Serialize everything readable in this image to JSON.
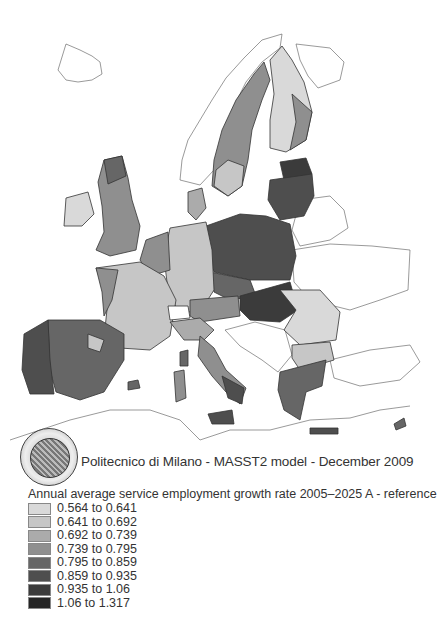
{
  "map": {
    "title": "Annual average service employment growth rate 2005–2025 A - reference",
    "caption": "Politecnico di Milano - MASST2 model - December 2009",
    "seal_text": "POLITECNICO DI MILANO",
    "classes": [
      {
        "label": "0.564 to 0.641",
        "color": "#d9d9d9"
      },
      {
        "label": "0.641 to 0.692",
        "color": "#c6c6c6"
      },
      {
        "label": "0.692 to 0.739",
        "color": "#ababab"
      },
      {
        "label": "0.739 to 0.795",
        "color": "#8f8f8f"
      },
      {
        "label": "0.795 to 0.859",
        "color": "#666666"
      },
      {
        "label": "0.859 to 0.935",
        "color": "#4e4e4e"
      },
      {
        "label": "0.935 to 1.06",
        "color": "#3b3b3b"
      },
      {
        "label": "1.06 to 1.317",
        "color": "#242424"
      }
    ],
    "regions": [
      {
        "name": "Norway",
        "class": null
      },
      {
        "name": "Sweden",
        "class": 3
      },
      {
        "name": "Finland",
        "class": 1
      },
      {
        "name": "Estonia/Latvia/Lithuania",
        "class": 6
      },
      {
        "name": "Poland",
        "class": 6
      },
      {
        "name": "Czech Republic",
        "class": 5
      },
      {
        "name": "Slovakia/Hungary",
        "class": 6
      },
      {
        "name": "Romania/Bulgaria",
        "class": 1
      },
      {
        "name": "Germany",
        "class": 1
      },
      {
        "name": "Denmark",
        "class": 2
      },
      {
        "name": "Benelux",
        "class": 4
      },
      {
        "name": "United Kingdom",
        "class": 4
      },
      {
        "name": "Ireland",
        "class": 1
      },
      {
        "name": "France",
        "class": 2
      },
      {
        "name": "Spain",
        "class": 5
      },
      {
        "name": "Portugal",
        "class": 5
      },
      {
        "name": "Italy",
        "class": 4
      },
      {
        "name": "Austria/Slovenia",
        "class": 4
      },
      {
        "name": "Greece",
        "class": 5
      },
      {
        "name": "Cyprus",
        "class": 5
      }
    ]
  }
}
